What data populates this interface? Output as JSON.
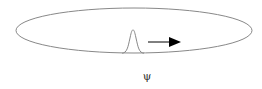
{
  "diagram": {
    "type": "wave-packet-on-ring",
    "label": "ψ",
    "colors": {
      "background": "#ffffff",
      "ring_stroke": "#888888",
      "packet_stroke": "#888888",
      "arrow": "#000000",
      "label": "#333333"
    },
    "ring": {
      "cx": 134,
      "cy": 30.5,
      "rx": 118,
      "ry": 22.5
    },
    "packet": {
      "peak_x": 133,
      "peak_y": 30,
      "base_left": 124,
      "base_right": 144,
      "base_y": 53
    },
    "arrow": {
      "x1": 148,
      "y1": 42,
      "x2": 181,
      "y2": 42,
      "direction": "right"
    }
  }
}
